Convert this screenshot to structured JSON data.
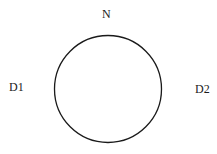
{
  "diagram": {
    "labels": {
      "top": "N",
      "left": "D1",
      "right": "D2"
    },
    "circle": {
      "cx": 108,
      "cy": 89,
      "r": 53.5,
      "stroke": "#1a1a1a",
      "fill": "#ffffff"
    }
  }
}
